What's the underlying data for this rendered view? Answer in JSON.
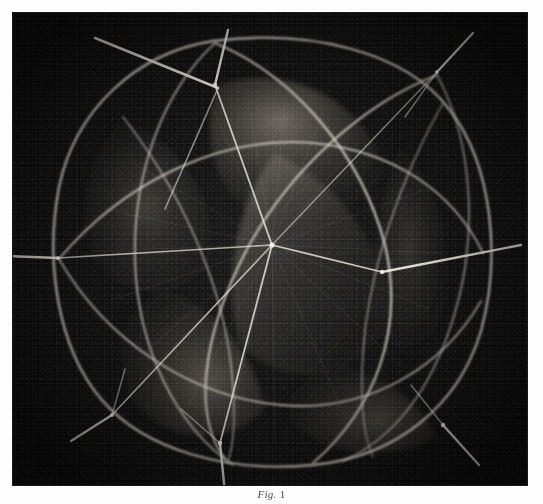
{
  "page": {
    "background_color": "#fdfdfd",
    "width": 543,
    "height": 504
  },
  "plate": {
    "name": "halftone-photographic-plate",
    "alt_text": "Photograph of a spherical geometric model formed by intersecting great circles with needle axes at the vertices",
    "background_color": "#0a0a0a",
    "line_color": "#d8d4c8",
    "shade_color": "#6f6a60",
    "frame": {
      "x": 13,
      "y": 13,
      "width": 514,
      "height": 472
    }
  },
  "model": {
    "title": "Spherical model of intersecting great circles",
    "center": {
      "x": 272,
      "y": 245
    },
    "radius": 205,
    "great_circle_count": 4,
    "vertices": [
      {
        "label": "top",
        "x": 215,
        "y": 85,
        "needle_angle_deg": -78,
        "needle_length": 62
      },
      {
        "label": "upper-right",
        "x": 437,
        "y": 72,
        "needle_angle_deg": -40,
        "needle_length": 58
      },
      {
        "label": "left",
        "x": 58,
        "y": 258,
        "needle_angle_deg": 182,
        "needle_length": 62
      },
      {
        "label": "right",
        "x": 382,
        "y": 272,
        "needle_angle_deg": 6,
        "needle_length": 140
      },
      {
        "label": "lower-left",
        "x": 112,
        "y": 415,
        "needle_angle_deg": 150,
        "needle_length": 58
      },
      {
        "label": "bottom",
        "x": 220,
        "y": 443,
        "needle_angle_deg": 96,
        "needle_length": 52
      },
      {
        "label": "lower-right",
        "x": 443,
        "y": 425,
        "needle_angle_deg": 46,
        "needle_length": 60
      },
      {
        "label": "center-node",
        "x": 272,
        "y": 245,
        "needle_angle_deg": 0,
        "needle_length": 0
      }
    ]
  },
  "caption": {
    "figure_label": "Fig.",
    "figure_number": "1",
    "text": ""
  }
}
